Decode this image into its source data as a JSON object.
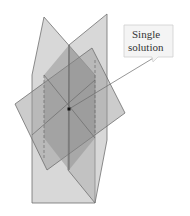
{
  "diagram": {
    "callout": {
      "line1": "Single",
      "line2": "solution"
    },
    "colors": {
      "plane_fill": "#9a9a9a",
      "plane_stroke": "#6e6e6e",
      "overlap": "#8a8a8a",
      "point": "#111111",
      "callout_bg": "#f4f4f4",
      "callout_border": "#cfcfcf"
    }
  }
}
